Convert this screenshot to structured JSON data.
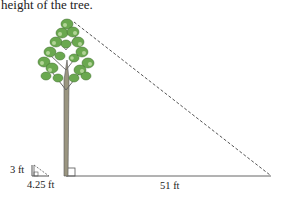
{
  "caption": "height of the tree.",
  "labels": {
    "small_height": "3 ft",
    "small_base": "4.25 ft",
    "large_base": "51 ft"
  },
  "diagram": {
    "colors": {
      "line": "#555555",
      "foliage": "#6aa84f",
      "foliage_light": "#b7d99a",
      "trunk": "#8a8470"
    }
  }
}
